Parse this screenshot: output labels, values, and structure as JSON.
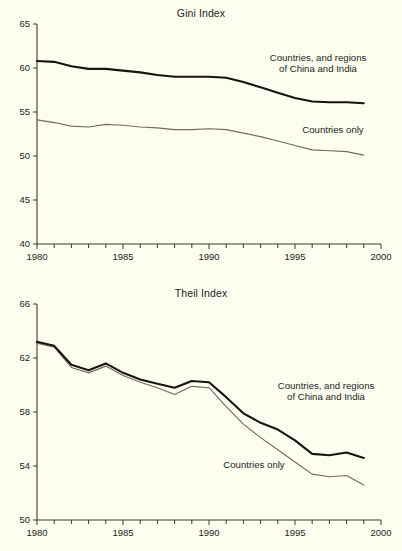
{
  "figure": {
    "background_color": "#fefef0",
    "line_color_thick": "#17150f",
    "line_color_thin": "#6e6c62",
    "axis_color": "#3a382e"
  },
  "chart_data": [
    {
      "type": "line",
      "title": "Gini Index",
      "xlabel": "",
      "ylabel": "",
      "xlim": [
        1980,
        2000
      ],
      "ylim": [
        40,
        65
      ],
      "grid": false,
      "legend_position": "inline-annotations",
      "xticks": [
        1980,
        1985,
        1990,
        1995,
        2000
      ],
      "xtick_labels": [
        "1980",
        "1985",
        "1990",
        "1995",
        "2000"
      ],
      "xtick_minor": [
        1981,
        1982,
        1983,
        1984,
        1986,
        1987,
        1988,
        1989,
        1991,
        1992,
        1993,
        1994,
        1996,
        1997,
        1998,
        1999
      ],
      "yticks": [
        40,
        45,
        50,
        55,
        60,
        65
      ],
      "ytick_labels": [
        "40",
        "45",
        "50",
        "55",
        "60",
        "65"
      ],
      "x": [
        1980,
        1981,
        1982,
        1983,
        1984,
        1985,
        1986,
        1987,
        1988,
        1989,
        1990,
        1991,
        1992,
        1993,
        1994,
        1995,
        1996,
        1997,
        1998,
        1999
      ],
      "series": [
        {
          "name": "Countries, and regions of China and India",
          "style": "thick-black",
          "values": [
            60.8,
            60.7,
            60.2,
            59.9,
            59.9,
            59.7,
            59.5,
            59.2,
            59.0,
            59.0,
            59.0,
            58.9,
            58.4,
            57.8,
            57.2,
            56.6,
            56.2,
            56.1,
            56.1,
            56.0
          ]
        },
        {
          "name": "Countries only",
          "style": "thin-gray",
          "values": [
            54.1,
            53.8,
            53.4,
            53.3,
            53.6,
            53.5,
            53.3,
            53.2,
            53.0,
            53.0,
            53.1,
            53.0,
            52.6,
            52.2,
            51.7,
            51.2,
            50.7,
            50.6,
            50.5,
            50.1
          ]
        }
      ],
      "annotations": [
        {
          "text": "Countries, and regions\nof China and India"
        },
        {
          "text": "Countries only"
        }
      ]
    },
    {
      "type": "line",
      "title": "Theil Index",
      "xlabel": "",
      "ylabel": "",
      "xlim": [
        1980,
        2000
      ],
      "ylim": [
        50,
        66
      ],
      "grid": false,
      "legend_position": "inline-annotations",
      "xticks": [
        1980,
        1985,
        1990,
        1995,
        2000
      ],
      "xtick_labels": [
        "1980",
        "1985",
        "1990",
        "1995",
        "2000"
      ],
      "xtick_minor": [
        1981,
        1982,
        1983,
        1984,
        1986,
        1987,
        1988,
        1989,
        1991,
        1992,
        1993,
        1994,
        1996,
        1997,
        1998,
        1999
      ],
      "yticks": [
        50,
        54,
        58,
        62,
        66
      ],
      "ytick_labels": [
        "50",
        "54",
        "58",
        "62",
        "66"
      ],
      "x": [
        1980,
        1981,
        1982,
        1983,
        1984,
        1985,
        1986,
        1987,
        1988,
        1989,
        1990,
        1991,
        1992,
        1993,
        1994,
        1995,
        1996,
        1997,
        1998,
        1999
      ],
      "series": [
        {
          "name": "Countries, and regions of China and India",
          "style": "thick-black",
          "values": [
            63.2,
            62.9,
            61.5,
            61.1,
            61.6,
            60.9,
            60.4,
            60.1,
            59.8,
            60.3,
            60.2,
            59.1,
            57.9,
            57.2,
            56.7,
            55.9,
            54.9,
            54.8,
            55.0,
            54.6
          ]
        },
        {
          "name": "Countries only",
          "style": "thin-gray",
          "values": [
            63.1,
            62.8,
            61.3,
            60.9,
            61.4,
            60.7,
            60.2,
            59.8,
            59.3,
            59.9,
            59.8,
            58.4,
            57.1,
            56.1,
            55.2,
            54.3,
            53.4,
            53.2,
            53.3,
            52.6
          ]
        }
      ],
      "annotations": [
        {
          "text": "Countries, and regions\nof China and India"
        },
        {
          "text": "Countries only"
        }
      ]
    }
  ]
}
